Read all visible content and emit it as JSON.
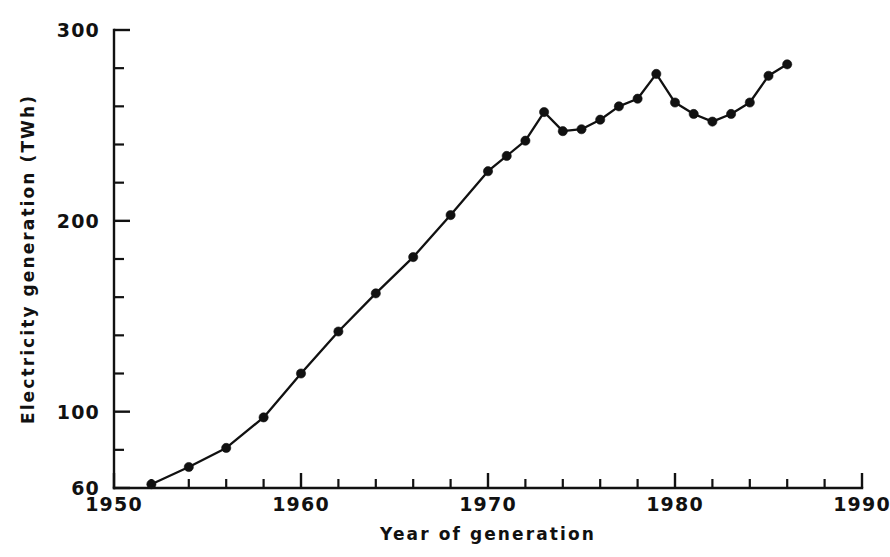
{
  "chart_data": {
    "type": "line",
    "title": "",
    "subtitle": "",
    "xlabel": "Year of generation",
    "ylabel": "Electricity generation (TWh)",
    "xlim": [
      1950,
      1990
    ],
    "ylim": [
      60,
      300
    ],
    "grid": false,
    "legend": null,
    "x_tick_labels": [
      "1950",
      "1960",
      "1970",
      "1980",
      "1990"
    ],
    "x_major_ticks": [
      1950,
      1960,
      1970,
      1980,
      1990
    ],
    "x_minor_ticks": [
      1952,
      1954,
      1956,
      1958,
      1962,
      1964,
      1966,
      1968,
      1972,
      1974,
      1976,
      1978,
      1982,
      1984,
      1986,
      1988
    ],
    "y_tick_labels": [
      "300",
      "200",
      "100",
      "60"
    ],
    "y_major_ticks": [
      300,
      200,
      100,
      60
    ],
    "y_minor_ticks": [
      280,
      260,
      240,
      220,
      180,
      160,
      140,
      120,
      80
    ],
    "series": [
      {
        "name": "Electricity generation",
        "marker": "filled-circle",
        "color": "#111111",
        "x": [
          1952,
          1954,
          1956,
          1958,
          1960,
          1962,
          1964,
          1966,
          1968,
          1970,
          1971,
          1972,
          1973,
          1974,
          1975,
          1976,
          1977,
          1978,
          1979,
          1980,
          1981,
          1982,
          1983,
          1984,
          1985,
          1986
        ],
        "values": [
          62,
          71,
          81,
          97,
          120,
          142,
          162,
          181,
          203,
          226,
          234,
          242,
          257,
          247,
          248,
          253,
          260,
          264,
          277,
          262,
          256,
          252,
          256,
          262,
          276,
          282
        ]
      }
    ]
  },
  "axes": {
    "x_axis_name": "year-of-generation-axis",
    "y_axis_name": "electricity-generation-axis"
  }
}
